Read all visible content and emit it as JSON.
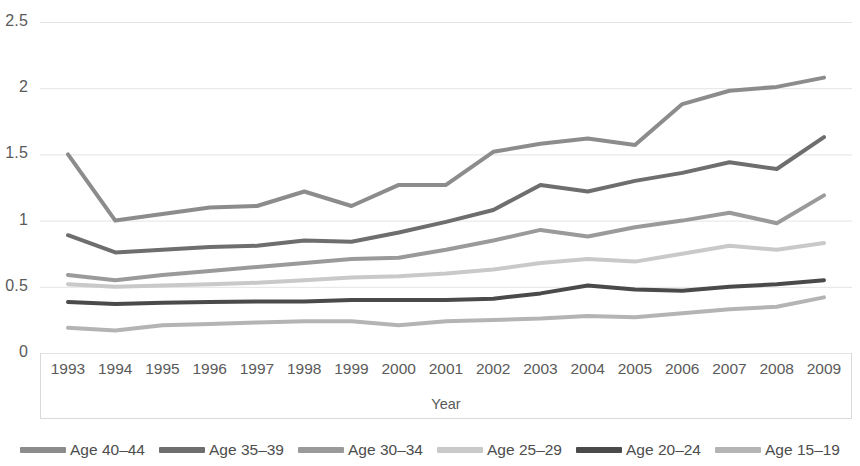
{
  "chart_data": {
    "type": "line",
    "title": "",
    "xlabel": "Year",
    "ylabel": "",
    "grid": true,
    "legend_position": "bottom",
    "xlim": [
      1993,
      2009
    ],
    "ylim": [
      0,
      2.5
    ],
    "y_ticks": [
      "0",
      "0.5",
      "1",
      "1.5",
      "2",
      "2.5"
    ],
    "y_tick_values": [
      0,
      0.5,
      1,
      1.5,
      2,
      2.5
    ],
    "categories": [
      "1993",
      "1994",
      "1995",
      "1996",
      "1997",
      "1998",
      "1999",
      "2000",
      "2001",
      "2002",
      "2003",
      "2004",
      "2005",
      "2006",
      "2007",
      "2008",
      "2009"
    ],
    "series": [
      {
        "name": "Age 40–44",
        "color": "#8c8c8c",
        "values": [
          1.5,
          1.0,
          1.05,
          1.1,
          1.11,
          1.22,
          1.11,
          1.27,
          1.27,
          1.52,
          1.58,
          1.62,
          1.57,
          1.88,
          1.98,
          2.01,
          2.08
        ]
      },
      {
        "name": "Age 35–39",
        "color": "#6e6e6e",
        "values": [
          0.89,
          0.76,
          0.78,
          0.8,
          0.81,
          0.85,
          0.84,
          0.91,
          0.99,
          1.08,
          1.27,
          1.22,
          1.3,
          1.36,
          1.44,
          1.39,
          1.63
        ]
      },
      {
        "name": "Age 30–34",
        "color": "#9a9a9a",
        "values": [
          0.59,
          0.55,
          0.59,
          0.62,
          0.65,
          0.68,
          0.71,
          0.72,
          0.78,
          0.85,
          0.93,
          0.88,
          0.95,
          1.0,
          1.06,
          0.98,
          1.19
        ]
      },
      {
        "name": "Age 25–29",
        "color": "#c9c9c9",
        "values": [
          0.52,
          0.5,
          0.51,
          0.52,
          0.53,
          0.55,
          0.57,
          0.58,
          0.6,
          0.63,
          0.68,
          0.71,
          0.69,
          0.75,
          0.81,
          0.78,
          0.83
        ]
      },
      {
        "name": "Age 20–24",
        "color": "#4a4a4a",
        "values": [
          0.385,
          0.37,
          0.38,
          0.385,
          0.39,
          0.39,
          0.4,
          0.4,
          0.4,
          0.41,
          0.45,
          0.51,
          0.48,
          0.47,
          0.5,
          0.52,
          0.55
        ]
      },
      {
        "name": "Age 15–19",
        "color": "#b4b4b4",
        "values": [
          0.19,
          0.17,
          0.21,
          0.22,
          0.23,
          0.24,
          0.24,
          0.21,
          0.24,
          0.25,
          0.26,
          0.28,
          0.27,
          0.3,
          0.33,
          0.35,
          0.42
        ]
      }
    ]
  },
  "axis": {
    "x_title": "Year"
  }
}
